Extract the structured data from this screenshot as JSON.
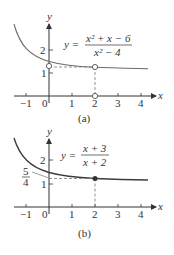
{
  "figures": [
    {
      "id": "a",
      "caption": "(a)",
      "equation": {
        "lhs": "y =",
        "numerator": "x² + x − 6",
        "denominator": "x² − 4"
      },
      "axes": {
        "x_label": "x",
        "y_label": "y",
        "x_ticks": [
          "−1",
          "0",
          "1",
          "2",
          "3",
          "4"
        ],
        "y_ticks": [
          "1",
          "2"
        ]
      },
      "markers": [
        {
          "type": "open",
          "x": 0,
          "y": 1.25
        },
        {
          "type": "open",
          "x": 2,
          "y": 1.25
        },
        {
          "type": "open",
          "x": 2,
          "y": 0
        }
      ]
    },
    {
      "id": "b",
      "caption": "(b)",
      "equation": {
        "lhs": "y =",
        "numerator": "x + 3",
        "denominator": "x + 2"
      },
      "axes": {
        "x_label": "x",
        "y_label": "y",
        "x_ticks": [
          "−1",
          "0",
          "1",
          "2",
          "3",
          "4"
        ],
        "y_ticks": [
          "1",
          "2"
        ]
      },
      "annotation": {
        "numerator": "5",
        "denominator": "4"
      },
      "markers": [
        {
          "type": "filled",
          "x": 2,
          "y": 1.25
        }
      ]
    }
  ],
  "colors": {
    "curve_a": "#6b6b6b",
    "curve_b": "#3d3d3d",
    "axis": "#333333",
    "dashed": "#777777"
  }
}
